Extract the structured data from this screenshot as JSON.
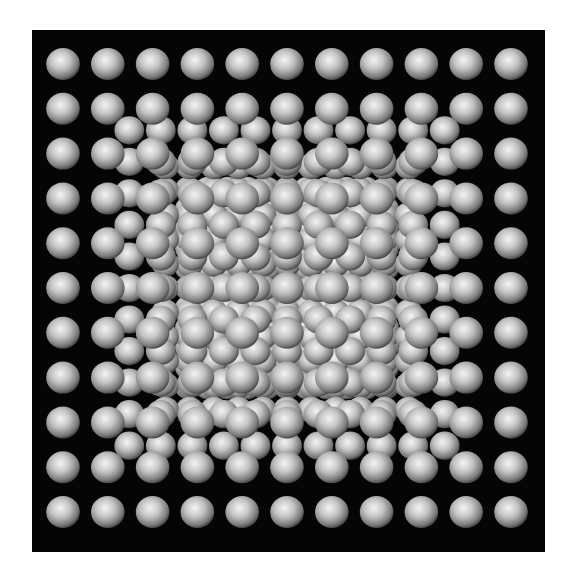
{
  "image": {
    "description": "3D rendering of a cubic lattice of grey spheres viewed head-on in perspective, rows converging to a central vanishing point",
    "background_color": "#050505",
    "page_background": "#ffffff",
    "sphere_color_highlight": "#f2f2f2",
    "sphere_color_mid": "#b8b8b8",
    "sphere_color_shadow": "#5a5a5a"
  },
  "lattice": {
    "front_grid_columns": 11,
    "front_grid_rows": 11,
    "depth_layers": 9,
    "vanishing_point": [
      255,
      258
    ],
    "front_spacing": 44.8,
    "front_radius": 16
  }
}
